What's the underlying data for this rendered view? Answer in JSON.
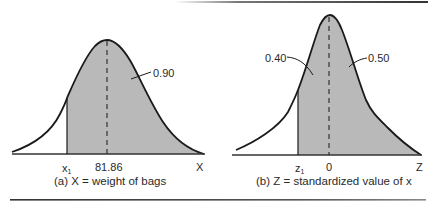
{
  "figure": {
    "panels": [
      {
        "id": "a",
        "caption": "(a) X  =  weight of bags",
        "axis_var": "X",
        "lower_label_main": "x",
        "lower_label_sub": "1",
        "mean_label": "81.86",
        "area_label": "0.90",
        "colors": {
          "shade": "#b9b9b9",
          "curve": "#1a1a1a",
          "axis": "#333333"
        }
      },
      {
        "id": "b",
        "caption": "(b) Z  =  standardized value of x",
        "axis_var": "Z",
        "lower_label_main": "z",
        "lower_label_sub": "1",
        "mean_label": "0",
        "area_left_label": "0.40",
        "area_right_label": "0.50",
        "colors": {
          "shade": "#b9b9b9",
          "curve": "#1a1a1a",
          "axis": "#333333"
        }
      }
    ]
  }
}
